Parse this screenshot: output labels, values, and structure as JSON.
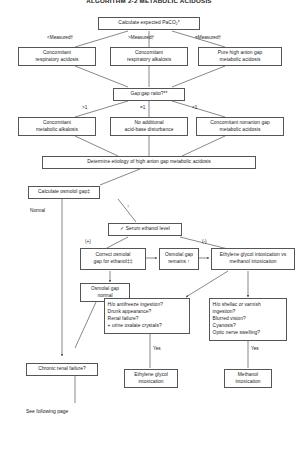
{
  "title": "ALGORITHM 2-2  METABOLIC ACIDOSIS",
  "nodes": {
    "calc_paco2": "Calculate expected PaCO₂*",
    "conc_resp_acidosis": [
      "Concomitant",
      "respiratory acidosis"
    ],
    "conc_resp_alkalosis": [
      "Concomitant",
      "respiratory alkalosis"
    ],
    "pure_high_anion_gap": [
      "Pure high anion gap",
      "metabolic acidosis"
    ],
    "gap_gap_ratio": "Gap:gap ratio?**",
    "conc_metabolic_alkalosis": [
      "Concomitant",
      "metabolic alkalosis"
    ],
    "no_additional": [
      "No additional",
      "acid-base disturbance"
    ],
    "conc_nonanion_gap": [
      "Concomitant nonanion gap",
      "metabolic acidosis"
    ],
    "determine_etiology": "Determine etiology of high anion gap metabolic acidosis",
    "calculate_osmolal_gap": "Calculate osmolol gap‡",
    "serum_ethanol_level": "✓ Serum ethanol level",
    "correct_osmolal_gap": [
      "Correct osmolal",
      "gap for ethanol‡‡"
    ],
    "osmolal_gap_remains": [
      "Osmolal gap",
      "remains ↑"
    ],
    "eg_vs_methanol": [
      "Ethylene glycol intoxication vs",
      "methanol  intoxication"
    ],
    "osmolal_gap_normal": [
      "Osmolal gap",
      "normal"
    ],
    "eg_questions": [
      "H/o antifreeze ingestion?",
      "Drunk appearance?",
      "Renal failure?",
      "+ urine oxalate crystals?"
    ],
    "methanol_questions": [
      "H/o shellac or varnish",
      "  ingestion?",
      "Blurred vision?",
      "Cyanosis?",
      "Optic nerve swelling?"
    ],
    "eg_intoxication": [
      "Ethylene glycol",
      "intoxication"
    ],
    "methanol_intoxication": [
      "Methanol",
      "intoxication"
    ],
    "chronic_renal_failure": "Chronic renal failure?"
  },
  "edge_labels": {
    "less_measured": "<Measured†",
    "greater_measured": ">Measured†",
    "equal_measured": "=Measured†",
    "gt_one": ">1",
    "eq_one": "=1",
    "lt_one": "<1",
    "normal": "Normal",
    "elevated": "↑",
    "positive": "(+)",
    "negative": "(-)",
    "yes_eg": "Yes",
    "yes_methanol": "Yes"
  },
  "footer": {
    "see_following_page": "See following page"
  },
  "colors": {
    "stroke": "#555555",
    "text": "#1a1a1a",
    "background": "#ffffff"
  }
}
